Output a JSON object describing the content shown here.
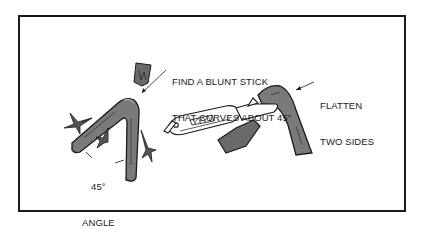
{
  "figure": {
    "type": "instructional-illustration",
    "labels": {
      "find_stick_line1": "FIND A BLUNT STICK",
      "find_stick_line2": "THAT CURVES ABOUT 45°",
      "flatten_line1": "FLATTEN",
      "flatten_line2": "TWO SIDES",
      "angle_line1": "45°",
      "angle_line2": "ANGLE"
    },
    "elements": [
      "bent-stick-with-leaves",
      "wood-chip",
      "pocket-knife",
      "flattened-bent-stick"
    ],
    "colors": {
      "stick_fill": "#7a7a7a",
      "outline": "#1a1a1a",
      "background": "#ffffff"
    }
  }
}
